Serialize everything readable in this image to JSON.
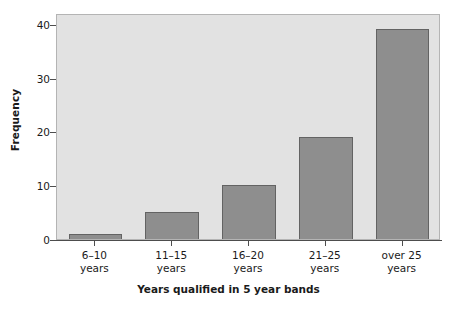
{
  "chart_data": {
    "type": "bar",
    "title": "",
    "categories": [
      "6–10 years",
      "11–15 years",
      "16–20 years",
      "21–25 years",
      "over 25 years"
    ],
    "category_lines": [
      [
        "6–10",
        "years"
      ],
      [
        "11–15",
        "years"
      ],
      [
        "16–20",
        "years"
      ],
      [
        "21–25",
        "years"
      ],
      [
        "over 25",
        "years"
      ]
    ],
    "values": [
      1,
      5,
      10,
      19,
      39
    ],
    "xlabel": "Years qualified in 5 year bands",
    "ylabel": "Frequency",
    "ylim": [
      0,
      42
    ],
    "yticks": [
      0,
      10,
      20,
      30,
      40
    ],
    "ytick_labels": [
      "0",
      "10",
      "20",
      "30",
      "40"
    ],
    "grid": false,
    "legend": false,
    "colors": {
      "bar_fill": "#8e8e8e",
      "bar_edge": "#636363",
      "plot_background": "#e2e2e2",
      "axis": "#4d4d4d",
      "text": "#1a1a1a",
      "page_background": "#ffffff"
    }
  }
}
